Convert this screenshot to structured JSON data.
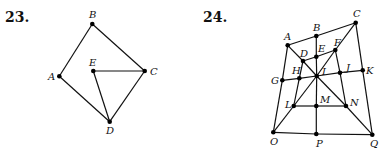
{
  "figures": [
    {
      "number": "23.",
      "points": {
        "A": [
          59.3,
          76.3
        ],
        "B": [
          92.3,
          24
        ],
        "C": [
          144.7,
          71
        ],
        "D": [
          109.7,
          121.7
        ],
        "E": [
          93.3,
          71
        ]
      },
      "labels": {
        "A": [
          48,
          80
        ],
        "B": [
          89,
          18
        ],
        "C": [
          150,
          75
        ],
        "D": [
          106,
          134
        ],
        "E": [
          89,
          66
        ]
      },
      "edges": [
        [
          "A",
          "B"
        ],
        [
          "B",
          "C"
        ],
        [
          "C",
          "D"
        ],
        [
          "D",
          "A"
        ],
        [
          "E",
          "C"
        ],
        [
          "E",
          "D"
        ]
      ]
    },
    {
      "number": "24.",
      "points": {
        "A": [
          287.7,
          45.3
        ],
        "B": [
          316.3,
          36
        ],
        "C": [
          355.7,
          22.7
        ],
        "D": [
          303,
          61
        ],
        "E": [
          316.3,
          56.7
        ],
        "F": [
          335.3,
          50
        ],
        "G": [
          282.3,
          80.3
        ],
        "H": [
          299.3,
          78.3
        ],
        "I": [
          316.7,
          76
        ],
        "J": [
          340,
          72.7
        ],
        "K": [
          362.7,
          70.3
        ],
        "L": [
          293.7,
          106
        ],
        "M": [
          316.3,
          106
        ],
        "N": [
          346,
          106
        ],
        "O": [
          273.3,
          132.3
        ],
        "P": [
          316.3,
          134
        ],
        "Q": [
          372.3,
          134.7
        ]
      },
      "labels": {
        "A": [
          284,
          40
        ],
        "B": [
          313,
          31
        ],
        "C": [
          353,
          17
        ],
        "D": [
          300,
          57
        ],
        "E": [
          318,
          52
        ],
        "F": [
          334,
          46
        ],
        "G": [
          271,
          84
        ],
        "H": [
          292,
          74
        ],
        "I": [
          322,
          75
        ],
        "J": [
          346,
          71
        ],
        "K": [
          366,
          74
        ],
        "L": [
          285,
          108
        ],
        "M": [
          320,
          103
        ],
        "N": [
          350,
          106
        ],
        "O": [
          270,
          145
        ],
        "P": [
          316,
          147
        ],
        "Q": [
          370,
          147
        ]
      },
      "edges": [
        [
          "A",
          "B"
        ],
        [
          "B",
          "C"
        ],
        [
          "C",
          "K"
        ],
        [
          "K",
          "Q"
        ],
        [
          "Q",
          "P"
        ],
        [
          "P",
          "O"
        ],
        [
          "O",
          "G"
        ],
        [
          "G",
          "A"
        ],
        [
          "A",
          "D"
        ],
        [
          "D",
          "I"
        ],
        [
          "I",
          "N"
        ],
        [
          "N",
          "Q"
        ],
        [
          "C",
          "F"
        ],
        [
          "F",
          "I"
        ],
        [
          "I",
          "L"
        ],
        [
          "L",
          "O"
        ],
        [
          "B",
          "E"
        ],
        [
          "E",
          "I"
        ],
        [
          "I",
          "M"
        ],
        [
          "M",
          "P"
        ],
        [
          "G",
          "H"
        ],
        [
          "H",
          "I"
        ],
        [
          "I",
          "J"
        ],
        [
          "J",
          "K"
        ],
        [
          "L",
          "M"
        ],
        [
          "M",
          "N"
        ],
        [
          "D",
          "E"
        ],
        [
          "E",
          "F"
        ],
        [
          "D",
          "H"
        ],
        [
          "H",
          "L"
        ],
        [
          "F",
          "J"
        ],
        [
          "J",
          "N"
        ]
      ]
    }
  ],
  "numbers": {
    "fig23": "23.",
    "fig24": "24."
  }
}
